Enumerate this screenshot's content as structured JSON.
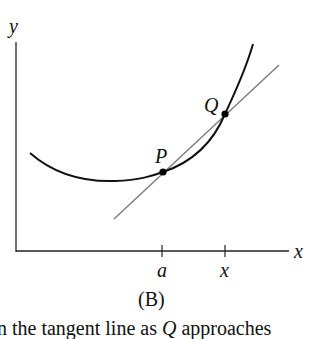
{
  "figure": {
    "caption": "(B)",
    "axis_labels": {
      "x": "x",
      "y": "y"
    },
    "tick_labels": {
      "a": "a",
      "x": "x"
    },
    "point_labels": {
      "P": "P",
      "Q": "Q"
    },
    "colors": {
      "curve": "#111111",
      "secant": "#7a7a7a",
      "axis": "#222222",
      "point": "#000000"
    }
  },
  "text": {
    "line_prefix": "n the tangent line as ",
    "line_var": "Q",
    "line_suffix": " approaches"
  }
}
